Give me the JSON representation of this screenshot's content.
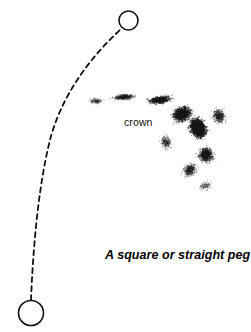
{
  "figure": {
    "width": 251,
    "height": 332,
    "background_color": "#ffffff",
    "ink_color": "#111111",
    "caption": "A square or straight peg",
    "crown_label": "crown"
  },
  "annotations": {
    "crown_label": {
      "text": "crown",
      "x": 124,
      "y": 116,
      "font_size_px": 10.5,
      "style": "regular"
    },
    "caption": {
      "text": "A square or straight peg",
      "x": 105,
      "y": 248,
      "font_size_px": 12.5,
      "style": "bold-italic"
    }
  },
  "markers": [
    {
      "name": "top-circle",
      "cx": 128.5,
      "cy": 20.5,
      "r": 9.5,
      "stroke": "#111111",
      "stroke_width": 1.6,
      "fill": "none"
    },
    {
      "name": "bottom-circle",
      "cx": 31,
      "cy": 313,
      "r": 12.5,
      "stroke": "#111111",
      "stroke_width": 1.6,
      "fill": "none"
    }
  ],
  "trajectory": {
    "name": "dashed-arc",
    "stroke": "#111111",
    "stroke_width": 1.8,
    "dash_pattern": "5 4",
    "path": "M 31 300 C 33 250, 38 188, 50 140 C 60 101, 85 62, 121 29",
    "start_point": [
      31,
      300
    ],
    "end_point": [
      121,
      29
    ]
  },
  "stipple_cloud": {
    "name": "crown-spray",
    "dot_color": "#1a1a1a",
    "description": "comma-shaped cloud of fine dots, densest near (196,128)",
    "lobes": [
      {
        "cx": 198,
        "cy": 128,
        "rx": 30,
        "ry": 40,
        "rot": -25,
        "count": 2600,
        "sigma": 0.42,
        "opacity": 0.95
      },
      {
        "cx": 182,
        "cy": 114,
        "rx": 34,
        "ry": 26,
        "rot": -18,
        "count": 1500,
        "sigma": 0.46,
        "opacity": 0.85
      },
      {
        "cx": 160,
        "cy": 100,
        "rx": 40,
        "ry": 13,
        "rot": -8,
        "count": 950,
        "sigma": 0.5,
        "opacity": 0.7
      },
      {
        "cx": 124,
        "cy": 97,
        "rx": 34,
        "ry": 9,
        "rot": -4,
        "count": 520,
        "sigma": 0.55,
        "opacity": 0.5
      },
      {
        "cx": 96,
        "cy": 101,
        "rx": 20,
        "ry": 9,
        "rot": 2,
        "count": 220,
        "sigma": 0.6,
        "opacity": 0.35
      },
      {
        "cx": 206,
        "cy": 155,
        "rx": 26,
        "ry": 28,
        "rot": -30,
        "count": 900,
        "sigma": 0.5,
        "opacity": 0.6
      },
      {
        "cx": 190,
        "cy": 170,
        "rx": 26,
        "ry": 20,
        "rot": -35,
        "count": 520,
        "sigma": 0.55,
        "opacity": 0.45
      },
      {
        "cx": 219,
        "cy": 116,
        "rx": 22,
        "ry": 26,
        "rot": -20,
        "count": 520,
        "sigma": 0.52,
        "opacity": 0.5
      },
      {
        "cx": 166,
        "cy": 142,
        "rx": 18,
        "ry": 22,
        "rot": -20,
        "count": 330,
        "sigma": 0.55,
        "opacity": 0.4
      },
      {
        "cx": 205,
        "cy": 186,
        "rx": 20,
        "ry": 14,
        "rot": -20,
        "count": 200,
        "sigma": 0.6,
        "opacity": 0.3
      }
    ]
  }
}
